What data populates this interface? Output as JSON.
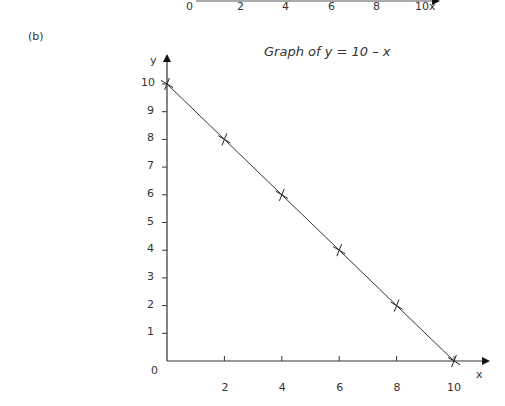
{
  "panel_label": "(b)",
  "top_axis_fragment": {
    "ticks": [
      "0",
      "2",
      "4",
      "6",
      "8",
      "10x"
    ]
  },
  "chart_data": {
    "type": "line",
    "title": "Graph of y = 10 – x",
    "xlabel": "x",
    "ylabel": "y",
    "x": [
      0,
      2,
      4,
      6,
      8,
      10
    ],
    "series": [
      {
        "name": "y = 10 - x",
        "values": [
          10,
          8,
          6,
          4,
          2,
          0
        ],
        "marker": "x"
      }
    ],
    "x_ticks": [
      "2",
      "4",
      "6",
      "8",
      "10"
    ],
    "y_ticks": [
      "1",
      "2",
      "3",
      "4",
      "5",
      "6",
      "7",
      "8",
      "9",
      "10"
    ],
    "origin_label": "0",
    "xlim": [
      0,
      10.9
    ],
    "ylim": [
      0,
      10.7
    ],
    "grid": false,
    "legend": false
  }
}
